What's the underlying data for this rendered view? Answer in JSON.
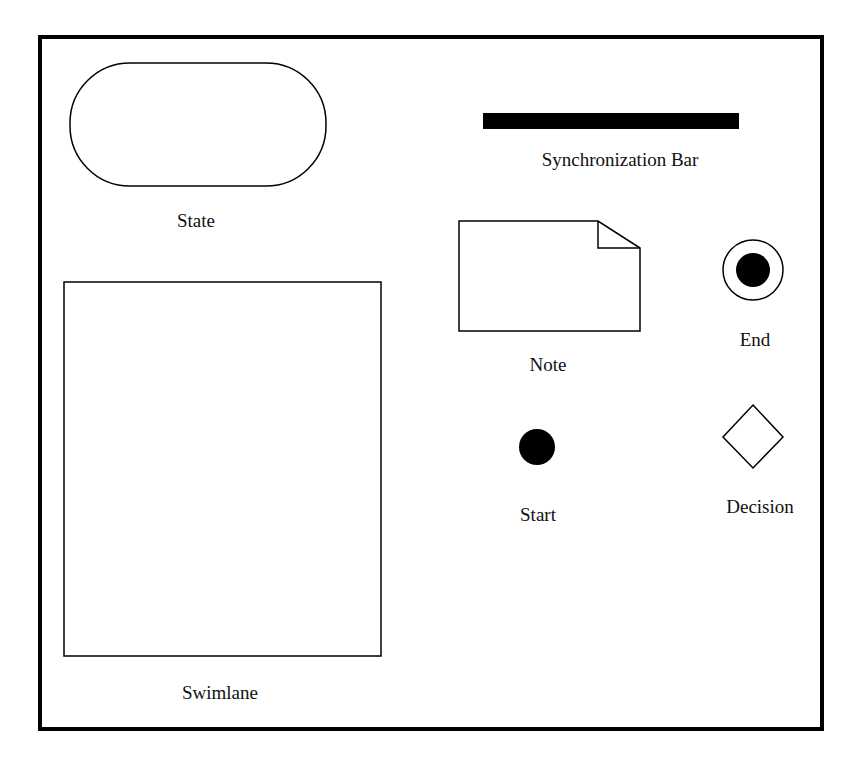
{
  "diagram": {
    "colors": {
      "stroke": "#000000",
      "fill": "#ffffff",
      "solid": "#000000",
      "frame": "#000000"
    },
    "elements": [
      {
        "id": "state",
        "type": "rounded-rect",
        "label": "State"
      },
      {
        "id": "sync-bar",
        "type": "bar",
        "label": "Synchronization Bar"
      },
      {
        "id": "note",
        "type": "note",
        "label": "Note"
      },
      {
        "id": "end",
        "type": "bullseye",
        "label": "End"
      },
      {
        "id": "start",
        "type": "filled-circle",
        "label": "Start"
      },
      {
        "id": "decision",
        "type": "diamond",
        "label": "Decision"
      },
      {
        "id": "swimlane",
        "type": "rect",
        "label": "Swimlane"
      }
    ]
  },
  "labels": {
    "state": "State",
    "sync_bar": "Synchronization Bar",
    "note": "Note",
    "end": "End",
    "start": "Start",
    "decision": "Decision",
    "swimlane": "Swimlane"
  }
}
